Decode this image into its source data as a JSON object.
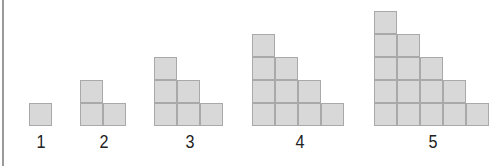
{
  "figure": {
    "colors": {
      "cell_fill": "#d8d8d8",
      "cell_border": "#a9a9a9",
      "label": "#222222",
      "left_rule": "#9a9a9a"
    },
    "stages": [
      {
        "label": "1",
        "columns": [
          1
        ],
        "x": 29,
        "label_x": 41
      },
      {
        "label": "2",
        "columns": [
          2,
          1
        ],
        "x": 80,
        "label_x": 104
      },
      {
        "label": "3",
        "columns": [
          3,
          2,
          1
        ],
        "x": 154,
        "label_x": 190
      },
      {
        "label": "4",
        "columns": [
          4,
          3,
          2,
          1
        ],
        "x": 252,
        "label_x": 300
      },
      {
        "label": "5",
        "columns": [
          5,
          4,
          3,
          2,
          1
        ],
        "x": 374,
        "label_x": 433
      }
    ]
  }
}
